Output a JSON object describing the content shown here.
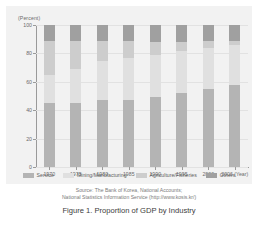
{
  "caption": "Figure 1. Proportion of GDP by Industry",
  "source": {
    "line1": "Source: The Bank of Korea, National Accounts;",
    "line2": "National Statistics Information Service (http://www.kosis.kr/)"
  },
  "legend": {
    "items": [
      {
        "label": "Service",
        "color": "#b4b4b4"
      },
      {
        "label": "Mining/Manufacturing",
        "color": "#e0e0e0"
      },
      {
        "label": "Agriculture/Fisheries",
        "color": "#cdcdcd"
      },
      {
        "label": "Others",
        "color": "#a0a0a0"
      }
    ]
  },
  "chart_data": {
    "type": "bar",
    "subtype": "stacked-100-percent",
    "title": "Figure 1. Proportion of GDP by Industry",
    "xlabel": "(Year)",
    "ylabel": "(Percent)",
    "ylim": [
      0,
      100
    ],
    "yticks": [
      0,
      20,
      40,
      60,
      80,
      100
    ],
    "ytick_labels": [
      "0",
      "20",
      "40",
      "60",
      "80",
      "100"
    ],
    "grid": true,
    "legend_position": "bottom",
    "categories": [
      "1970",
      "1975",
      "1980",
      "1985",
      "1990",
      "1995",
      "2000",
      "2006"
    ],
    "xtick_labels": [
      "1970",
      "1975",
      "1980",
      "1985",
      "1990",
      "1995",
      "2000",
      "2006 (Year)"
    ],
    "series": [
      {
        "name": "Service",
        "color": "#b4b4b4",
        "values": [
          45,
          45,
          47,
          47,
          49,
          52,
          55,
          58
        ]
      },
      {
        "name": "Mining/Manufacturing",
        "color": "#e0e0e0",
        "values": [
          20,
          24,
          28,
          30,
          30,
          30,
          29,
          28
        ]
      },
      {
        "name": "Agriculture/Fisheries",
        "color": "#cdcdcd",
        "values": [
          24,
          20,
          14,
          12,
          9,
          6,
          5,
          3
        ]
      },
      {
        "name": "Others",
        "color": "#a0a0a0",
        "values": [
          11,
          11,
          11,
          11,
          12,
          12,
          11,
          11
        ]
      }
    ]
  }
}
